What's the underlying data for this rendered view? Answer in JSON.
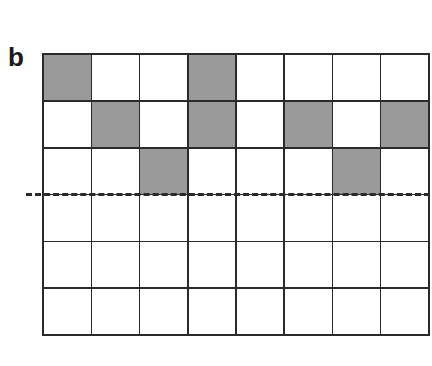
{
  "panel": {
    "label": "b"
  },
  "grid": {
    "rows": 6,
    "cols": 8,
    "fill_color": "#9a9a9a",
    "empty_color": "#ffffff",
    "line_color": "#2a2a2a",
    "filled_cells": [
      [
        0,
        0
      ],
      [
        0,
        3
      ],
      [
        1,
        1
      ],
      [
        1,
        3
      ],
      [
        1,
        5
      ],
      [
        1,
        7
      ],
      [
        2,
        2
      ],
      [
        2,
        6
      ]
    ]
  },
  "threshold_line": {
    "style": "dashed",
    "after_row": 3
  }
}
